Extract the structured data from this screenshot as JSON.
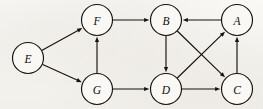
{
  "figure": {
    "type": "directed-graph",
    "background_color": "#f7f5f1",
    "ink_color": "#15120f",
    "width": 263,
    "height": 109,
    "node_radius": 15.5
  },
  "nodes": [
    {
      "id": "E",
      "label": "E",
      "x": 28,
      "y": 58
    },
    {
      "id": "F",
      "label": "F",
      "x": 97,
      "y": 20
    },
    {
      "id": "B",
      "label": "B",
      "x": 166,
      "y": 20
    },
    {
      "id": "A",
      "label": "A",
      "x": 237,
      "y": 20
    },
    {
      "id": "G",
      "label": "G",
      "x": 97,
      "y": 89
    },
    {
      "id": "D",
      "label": "D",
      "x": 166,
      "y": 89
    },
    {
      "id": "C",
      "label": "C",
      "x": 237,
      "y": 89
    }
  ],
  "edges": [
    {
      "from": "E",
      "to": "F",
      "directed": true
    },
    {
      "from": "E",
      "to": "G",
      "directed": true
    },
    {
      "from": "G",
      "to": "F",
      "directed": true
    },
    {
      "from": "F",
      "to": "B",
      "directed": true
    },
    {
      "from": "A",
      "to": "B",
      "directed": true
    },
    {
      "from": "B",
      "to": "D",
      "directed": true
    },
    {
      "from": "B",
      "to": "C",
      "directed": true
    },
    {
      "from": "D",
      "to": "A",
      "directed": true
    },
    {
      "from": "C",
      "to": "A",
      "directed": true
    },
    {
      "from": "G",
      "to": "D",
      "directed": true
    },
    {
      "from": "D",
      "to": "C",
      "directed": true
    }
  ]
}
